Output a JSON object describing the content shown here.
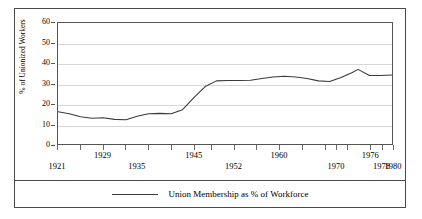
{
  "chart_data": {
    "type": "line",
    "title": "",
    "subtitle": "",
    "xlabel": "",
    "ylabel": "% of Unionized Workers",
    "xlim": [
      1921,
      1980
    ],
    "ylim": [
      0,
      60
    ],
    "grid": true,
    "legend_position": "bottom-center",
    "y_ticks": [
      0,
      10,
      20,
      30,
      40,
      50,
      60
    ],
    "y_tick_labels": [
      "0",
      "10",
      "20",
      "30",
      "40",
      "50",
      "60"
    ],
    "x_ticks": [
      1921,
      1925,
      1929,
      1933,
      1937,
      1941,
      1945,
      1948,
      1952,
      1956,
      1960,
      1964,
      1968,
      1970,
      1972,
      1976,
      1978,
      1980
    ],
    "x_tick_labels_top_row": [
      "1929",
      "1945",
      "1960",
      "1976"
    ],
    "x_tick_labels_bottom_row": [
      "1921",
      "1935",
      "1952",
      "1970",
      "1978",
      "1980"
    ],
    "series": [
      {
        "name": "Union Membership as % of Workforce",
        "color": "#3a3a3a",
        "x": [
          1921,
          1923,
          1925,
          1927,
          1929,
          1931,
          1933,
          1935,
          1937,
          1939,
          1941,
          1943,
          1945,
          1947,
          1949,
          1951,
          1953,
          1955,
          1957,
          1959,
          1961,
          1963,
          1965,
          1967,
          1969,
          1971,
          1973,
          1974,
          1976,
          1978,
          1980
        ],
        "values": [
          16.0,
          15.0,
          13.5,
          12.8,
          13.0,
          12.2,
          12.0,
          13.8,
          15.0,
          15.2,
          15.0,
          17.0,
          23.0,
          28.5,
          31.3,
          31.5,
          31.5,
          31.6,
          32.5,
          33.2,
          33.6,
          33.2,
          32.5,
          31.3,
          31.0,
          33.0,
          35.5,
          37.0,
          34.0,
          34.0,
          34.2
        ]
      }
    ]
  },
  "legend": {
    "label": "Union Membership as % of Workforce"
  }
}
